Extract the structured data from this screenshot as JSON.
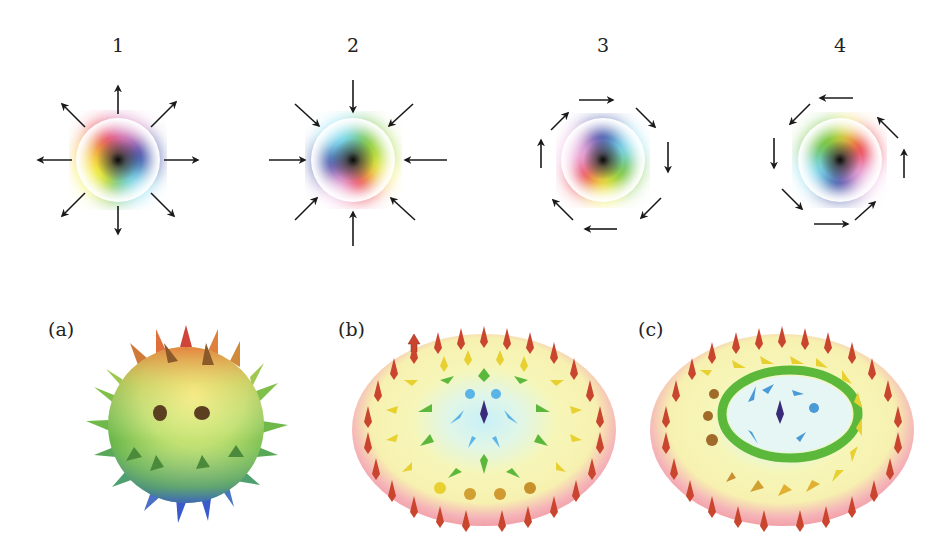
{
  "top_row": {
    "panels": [
      {
        "label": "1",
        "type": "hedgehog-outward",
        "center": [
          118,
          160
        ]
      },
      {
        "label": "2",
        "type": "hedgehog-inward",
        "center": [
          353,
          160
        ]
      },
      {
        "label": "3",
        "type": "vortex-clockwise",
        "center": [
          603,
          160
        ]
      },
      {
        "label": "4",
        "type": "vortex-counterclockwise",
        "center": [
          840,
          160
        ]
      }
    ]
  },
  "bottom_row": {
    "panels": [
      {
        "label": "(a)",
        "description": "spiky sphere colored red (top) to green to blue (bottom)"
      },
      {
        "label": "(b)",
        "description": "Néel-type skyrmion arrow field on disk"
      },
      {
        "label": "(c)",
        "description": "Bloch-type skyrmion arrow field on disk"
      }
    ]
  },
  "colors": {
    "arrow": "#1a1a1a",
    "red": "#e8323c",
    "yellow": "#f5f03c",
    "green": "#6cc23a",
    "cyan": "#7fdcf5",
    "blue": "#3e4fa8",
    "magenta": "#e89ad8",
    "disk_edge": "#f2a0a8",
    "disk_mid": "#f8f5b0",
    "arrow_red": "#c9452e"
  }
}
